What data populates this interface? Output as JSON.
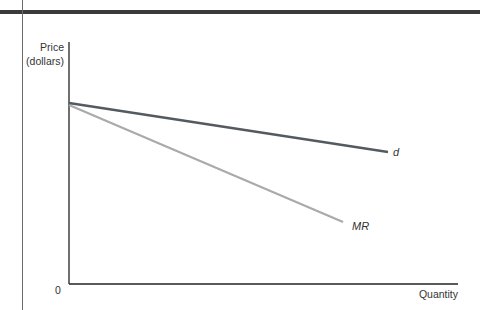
{
  "chart_data": {
    "type": "line",
    "title": "",
    "xlabel": "Quantity",
    "ylabel": "Price (dollars)",
    "ylabel_lines": [
      "Price",
      "(dollars)"
    ],
    "origin_label": "0",
    "grid": false,
    "legend": "inline labels at line ends",
    "series": [
      {
        "name": "d",
        "label": "d",
        "color": "#555a60",
        "style": "italic",
        "x": [
          0,
          1
        ],
        "y": [
          1.0,
          0.73
        ],
        "pixels": {
          "x1": 69,
          "y1": 103,
          "x2": 388,
          "y2": 152
        }
      },
      {
        "name": "MR",
        "label": "MR",
        "color": "#a8aaac",
        "style": "italic",
        "x": [
          0,
          1
        ],
        "y": [
          1.0,
          0.33
        ],
        "pixels": {
          "x1": 69,
          "y1": 105,
          "x2": 343,
          "y2": 222
        }
      }
    ],
    "axes": {
      "origin": {
        "x": 69,
        "y": 284
      },
      "y_top": 42,
      "x_right": 458
    }
  },
  "colors": {
    "top_bar": "#3a3a3a",
    "axis": "#222222",
    "d_line": "#555a60",
    "mr_line": "#a8aaac"
  }
}
